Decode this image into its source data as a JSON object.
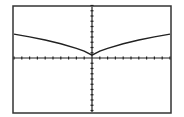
{
  "chart_data": {
    "type": "line",
    "title": "",
    "xlabel": "",
    "ylabel": "",
    "function_shape": "y = |x|^(2/3) shifted (cusp at origin, concave down)",
    "xlim": [
      -10,
      10
    ],
    "ylim": [
      -10,
      10
    ],
    "x_ticks_per_side": 10,
    "y_ticks_per_side": 10,
    "grid": false,
    "series": [
      {
        "name": "f(x)",
        "x": [
          -10,
          -8,
          -6,
          -4,
          -2,
          -1,
          0,
          1,
          2,
          4,
          6,
          8,
          10
        ],
        "values": [
          5.2,
          4.6,
          3.9,
          3.1,
          2.1,
          1.5,
          0.6,
          1.5,
          2.1,
          3.1,
          3.9,
          4.6,
          5.2
        ]
      }
    ],
    "colors": {
      "axes": "#222222",
      "curve": "#222222",
      "frame": "#333333",
      "background": "#ffffff"
    }
  }
}
